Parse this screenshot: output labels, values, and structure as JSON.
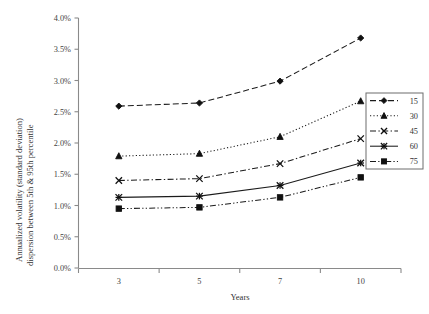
{
  "chart_data": {
    "type": "line",
    "title": "",
    "xlabel": "Years",
    "ylabel": "Annualized volatility (standard deviation) dispersion between 5th & 95th percentile",
    "ylabel_line1": "Annualized volatility (standard deviation)",
    "ylabel_line2": "dispersion between 5th & 95th percentile",
    "categories": [
      "3",
      "5",
      "7",
      "10"
    ],
    "x": [
      3,
      5,
      7,
      10
    ],
    "ylim": [
      0.0,
      4.0
    ],
    "ytick_step": 0.5,
    "ytick_labels": [
      "0.0%",
      "0.5%",
      "1.0%",
      "1.5%",
      "2.0%",
      "2.5%",
      "3.0%",
      "3.5%",
      "4.0%"
    ],
    "ytick_values": [
      0.0,
      0.5,
      1.0,
      1.5,
      2.0,
      2.5,
      3.0,
      3.5,
      4.0
    ],
    "grid": false,
    "legend_position": "right-outside",
    "series": [
      {
        "name": "15",
        "marker": "diamond",
        "dash": "dashed",
        "values": [
          2.59,
          2.64,
          2.99,
          3.68
        ]
      },
      {
        "name": "30",
        "marker": "triangle",
        "dash": "dotted",
        "values": [
          1.79,
          1.83,
          2.1,
          2.67
        ]
      },
      {
        "name": "45",
        "marker": "cross",
        "dash": "dash-dot",
        "values": [
          1.4,
          1.43,
          1.67,
          2.07
        ]
      },
      {
        "name": "60",
        "marker": "asterisk",
        "dash": "solid",
        "values": [
          1.13,
          1.15,
          1.32,
          1.68
        ]
      },
      {
        "name": "75",
        "marker": "square",
        "dash": "dash-dot-dot",
        "values": [
          0.95,
          0.97,
          1.13,
          1.45
        ]
      }
    ]
  },
  "legend": {
    "entries": [
      "15",
      "30",
      "45",
      "60",
      "75"
    ]
  }
}
